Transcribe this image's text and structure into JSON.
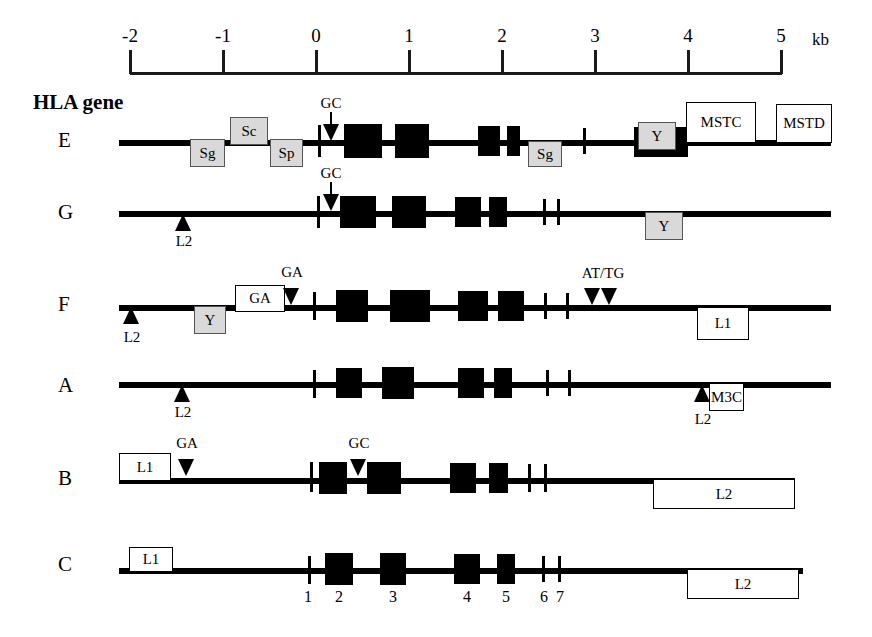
{
  "figure": {
    "title": "HLA gene",
    "width": 872,
    "height": 637
  },
  "scale": {
    "unit": "kb",
    "ticks": [
      {
        "label": "-2",
        "kb": -2
      },
      {
        "label": "-1",
        "kb": -1
      },
      {
        "label": "0",
        "kb": 0
      },
      {
        "label": "1",
        "kb": 1
      },
      {
        "label": "2",
        "kb": 2
      },
      {
        "label": "3",
        "kb": 3
      },
      {
        "label": "4",
        "kb": 4
      },
      {
        "label": "5",
        "kb": 5
      }
    ]
  },
  "exon_numbers": [
    {
      "label": "1"
    },
    {
      "label": "2"
    },
    {
      "label": "3"
    },
    {
      "label": "4"
    },
    {
      "label": "5"
    },
    {
      "label": "6"
    },
    {
      "label": "7"
    }
  ],
  "genes": [
    {
      "name": "E",
      "markers": [
        {
          "kind": "arrow-down",
          "label": "GC"
        }
      ],
      "gray_boxes": [
        {
          "label": "Sg"
        },
        {
          "label": "Sc"
        },
        {
          "label": "Sp"
        },
        {
          "label": "Sg"
        },
        {
          "label": "Y"
        }
      ],
      "white_boxes": [
        {
          "label": "MSTC"
        },
        {
          "label": "MSTD"
        }
      ]
    },
    {
      "name": "G",
      "markers": [
        {
          "kind": "arrow-down",
          "label": "GC"
        },
        {
          "kind": "triangle-up",
          "label": "L2"
        }
      ],
      "gray_boxes": [
        {
          "label": "Y"
        }
      ],
      "white_boxes": []
    },
    {
      "name": "F",
      "markers": [
        {
          "kind": "triangle-up",
          "label": "L2"
        },
        {
          "kind": "triangle-down",
          "label": "GA"
        },
        {
          "kind": "triangle-down",
          "label": "AT/TG"
        },
        {
          "kind": "triangle-down",
          "label": ""
        }
      ],
      "gray_boxes": [
        {
          "label": "Y"
        }
      ],
      "white_boxes": [
        {
          "label": "GA"
        },
        {
          "label": "L1"
        }
      ]
    },
    {
      "name": "A",
      "markers": [
        {
          "kind": "triangle-up",
          "label": "L2"
        },
        {
          "kind": "triangle-up",
          "label": "L2"
        }
      ],
      "gray_boxes": [],
      "white_boxes": [
        {
          "label": "M3C"
        }
      ]
    },
    {
      "name": "B",
      "markers": [
        {
          "kind": "triangle-down",
          "label": "GA"
        },
        {
          "kind": "triangle-down",
          "label": "GC"
        }
      ],
      "gray_boxes": [],
      "white_boxes": [
        {
          "label": "L1"
        },
        {
          "label": "L2"
        }
      ]
    },
    {
      "name": "C",
      "markers": [],
      "gray_boxes": [],
      "white_boxes": [
        {
          "label": "L1"
        },
        {
          "label": "L2"
        }
      ]
    }
  ],
  "labels": {
    "E_GC": "GC",
    "G_GC": "GC",
    "F_GA_top": "GA",
    "F_GA_box": "GA",
    "F_ATTG": "AT/TG",
    "F_L2": "L2",
    "F_Y": "Y",
    "F_L1": "L1",
    "E_Sg1": "Sg",
    "E_Sc": "Sc",
    "E_Sp": "Sp",
    "E_Sg2": "Sg",
    "E_Y": "Y",
    "E_MSTC": "MSTC",
    "E_MSTD": "MSTD",
    "G_L2": "L2",
    "G_Y": "Y",
    "A_L2a": "L2",
    "A_L2b": "L2",
    "A_M3C": "M3C",
    "B_L1": "L1",
    "B_GA": "GA",
    "B_GC": "GC",
    "B_L2": "L2",
    "C_L1": "L1",
    "C_L2": "L2"
  }
}
